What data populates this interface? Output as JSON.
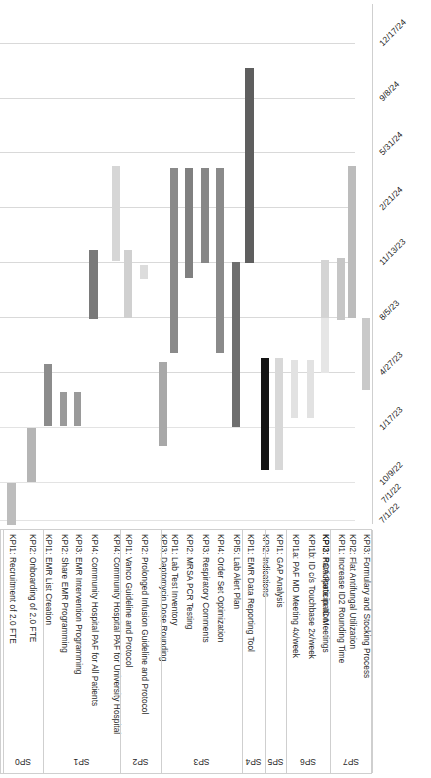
{
  "chart_data": {
    "type": "bar",
    "title": "",
    "subtitle": "",
    "xlabel": "",
    "ylabel": "",
    "orientation": "rotated-gantt",
    "grid": true,
    "legend": "none",
    "axis": {
      "name": "date-axis",
      "position": "right",
      "ticks": [
        "12/17/24",
        "9/8/24",
        "5/31/24",
        "2/21/24",
        "11/13/23",
        "8/5/23",
        "4/27/23",
        "1/17/23",
        "10/9/22",
        "7/1/22"
      ],
      "tick_y_px": [
        43,
        98,
        152,
        207,
        262,
        317,
        372,
        427,
        482,
        520
      ],
      "range": [
        "7/1/22",
        "12/17/24"
      ],
      "direction": "descending-downward"
    },
    "groups": [
      {
        "id": "SP0",
        "label": "SP0",
        "x": 2,
        "w": 40
      },
      {
        "id": "SP1",
        "label": "SP1",
        "x": 42,
        "w": 77
      },
      {
        "id": "SP2",
        "label": "SP2",
        "x": 119,
        "w": 41
      },
      {
        "id": "SP3",
        "label": "SP3",
        "x": 160,
        "w": 81
      },
      {
        "id": "SP4",
        "label": "SP4",
        "x": 241,
        "w": 23
      },
      {
        "id": "SP5",
        "label": "SP5",
        "x": 264,
        "w": 21
      },
      {
        "id": "SP6",
        "label": "SP6",
        "x": 285,
        "w": 44
      },
      {
        "id": "SP7",
        "label": "SP7",
        "x": 329,
        "w": 42
      }
    ],
    "categories": [
      "KPI1: Recruitment of 2.0 FTE",
      "KPI2: Onboarding of 2.0 FTE",
      "KPI1: EMR List Creation",
      "KPI2: Share EMR Programming",
      "KPI3: EMR Intervention Programming",
      "KPI4: Community Hospital PAF for All Patients",
      "KPI4: Community Hospital PAF for University Hospital",
      "KPI1: Vanco Guideline and Protocol",
      "KPI2: Prolonged Infusion Guideline and Protocol",
      "KPI3: Daptomycin Dose Rounding",
      "KPI1: Lab Test Inventory",
      "KPI2: MRSA PCR Testing",
      "KPI3: Respiratory Comments",
      "KPI4: Order Set Optimization",
      "KPI5: Lab Alert Plan",
      "KPI1: EMR Data Reporting Tool",
      "KPI2: Indications",
      "KPI1: GAP Analysis",
      "KPI1a: PAF MD Meeting 4x/week",
      "KPI1b: ID c/s Touchbase 2x/week",
      "KPI2: Participate in IC Meetings",
      "KPI3: RCA Participation",
      "KPI1: Increase ID2 Rounding Time",
      "KPI2: Flat Antifungal Utilization",
      "KPI3: Formulary and Stocking Process"
    ],
    "bars": [
      {
        "name": "KPI1: Recruitment of 2.0 FTE",
        "group": "SP0",
        "x": 7,
        "w": 9,
        "y": 483,
        "h": 42,
        "color": "#bdbdbd",
        "start": "~7/1/22",
        "end": "~10/9/22"
      },
      {
        "name": "KPI2: Onboarding of 2.0 FTE",
        "group": "SP0",
        "x": 27,
        "w": 9,
        "y": 428,
        "h": 54,
        "color": "#b5b5b5",
        "start": "~10/9/22",
        "end": "~1/17/23"
      },
      {
        "name": "KPI1: EMR List Creation",
        "group": "SP1",
        "x": 44,
        "w": 8,
        "y": 364,
        "h": 62,
        "color": "#8c8c8c",
        "start": "~1/10/23",
        "end": "~4/27/23"
      },
      {
        "name": "KPI2: Share EMR Programming",
        "group": "SP1",
        "x": 60,
        "w": 7,
        "y": 392,
        "h": 34,
        "color": "#9a9a9a",
        "start": "~1/17/23",
        "end": "~3/20/23"
      },
      {
        "name": "KPI3: EMR Intervention Programming",
        "group": "SP1",
        "x": 74,
        "w": 7,
        "y": 392,
        "h": 34,
        "color": "#9a9a9a",
        "start": "~1/17/23",
        "end": "~3/20/23"
      },
      {
        "name": "KPI4: Community Hospital PAF for All Patients",
        "group": "SP1",
        "x": 89,
        "w": 9,
        "y": 250,
        "h": 69,
        "color": "#7a7a7a",
        "start": "~4/27/23",
        "end": "~9/20/23"
      },
      {
        "name": "KPI4: Community Hospital PAF for University Hosp.",
        "group": "SP1",
        "x": 112,
        "w": 8,
        "y": 166,
        "h": 95,
        "color": "#d6d6d6",
        "start": "~9/20/23",
        "end": "~2/28/24"
      },
      {
        "name": "KPI1: Vanco Guideline and Protocol",
        "group": "SP2",
        "x": 124,
        "w": 8,
        "y": 250,
        "h": 68,
        "color": "#d0d0d0",
        "start": "~4/27/23",
        "end": "~9/20/23"
      },
      {
        "name": "KPI2: Prolonged Infusion Guideline and Protocol",
        "group": "SP2",
        "x": 140,
        "w": 8,
        "y": 265,
        "h": 14,
        "color": "#dcdcdc",
        "start": "~8/5/23",
        "end": "~9/15/23"
      },
      {
        "name": "KPI3: Daptomycin Dose Rounding",
        "group": "SP2",
        "x": 159,
        "w": 8,
        "y": 362,
        "h": 84,
        "color": "#a8a8a8",
        "start": "~12/1/22",
        "end": "~4/27/23"
      },
      {
        "name": "KPI1: Lab Test Inventory",
        "group": "SP3",
        "x": 170,
        "w": 8,
        "y": 168,
        "h": 185,
        "color": "#8a8a8a",
        "start": "~4/27/23",
        "end": "~2/21/24"
      },
      {
        "name": "KPI2: MRSA PCR Testing",
        "group": "SP3",
        "x": 185,
        "w": 8,
        "y": 168,
        "h": 110,
        "color": "#808080",
        "start": "~9/20/23",
        "end": "~2/21/24"
      },
      {
        "name": "KPI3: Respiratory Comments",
        "group": "SP3",
        "x": 201,
        "w": 8,
        "y": 168,
        "h": 95,
        "color": "#878787",
        "start": "~11/13/23",
        "end": "~2/21/24"
      },
      {
        "name": "KPI4: Order Set Optimization",
        "group": "SP3",
        "x": 216,
        "w": 8,
        "y": 168,
        "h": 185,
        "color": "#8a8a8a",
        "start": "~4/27/23",
        "end": "~2/21/24"
      },
      {
        "name": "KPI5: Lab Alert Plan",
        "group": "SP3",
        "x": 232,
        "w": 8,
        "y": 262,
        "h": 165,
        "color": "#6e6e6e",
        "start": "~1/17/23",
        "end": "~11/13/23"
      },
      {
        "name": "KPI1: EMR Data Reporting Tool",
        "group": "SP4",
        "x": 245,
        "w": 9,
        "y": 68,
        "h": 195,
        "color": "#5e5e5e",
        "start": "~11/13/23",
        "end": "~9/8/24"
      },
      {
        "name": "KPI2: Indications",
        "group": "SP4",
        "x": 261,
        "w": 8,
        "y": 358,
        "h": 112,
        "color": "#141414",
        "start": "~12/1/22",
        "end": "~4/27/23"
      },
      {
        "name": "KPI1: GAP Analysis",
        "group": "SP5",
        "x": 275,
        "w": 8,
        "y": 358,
        "h": 112,
        "color": "#d8d8d8",
        "start": "~12/1/22",
        "end": "~4/27/23"
      },
      {
        "name": "KPI1a: PAF MD Meeting 4x/week",
        "group": "SP6",
        "x": 291,
        "w": 7,
        "y": 360,
        "h": 58,
        "color": "#e2e2e2",
        "start": "~2/5/23",
        "end": "~4/27/23"
      },
      {
        "name": "KPI1b: ID c/s Touchbase 2x/week",
        "group": "SP6",
        "x": 307,
        "w": 7,
        "y": 360,
        "h": 58,
        "color": "#e2e2e2",
        "start": "~2/5/23",
        "end": "~4/27/23"
      },
      {
        "name": "KPI2: Participate in IC Meetings",
        "group": "SP6",
        "x": 321,
        "w": 8,
        "y": 260,
        "h": 58,
        "color": "#d4d4d4",
        "start": "~4/27/23",
        "end": "~8/5/23"
      },
      {
        "name": "KPI3: RCA Participation",
        "group": "SP6",
        "x": 321,
        "w": 8,
        "y": 318,
        "h": 55,
        "color": "#e6e6e6",
        "start": "~4/27/23",
        "end": "~8/5/23"
      },
      {
        "name": "KPI1: Increase ID2 Rounding Time",
        "group": "SP7",
        "x": 337,
        "w": 8,
        "y": 258,
        "h": 62,
        "color": "#c6c6c6",
        "start": "~4/27/23",
        "end": "~8/5/23"
      },
      {
        "name": "KPI2: Flat Antifungal Utilization",
        "group": "SP7",
        "x": 348,
        "w": 8,
        "y": 166,
        "h": 152,
        "color": "#bcbcbc",
        "start": "~4/27/23",
        "end": "~2/21/24"
      },
      {
        "name": "KPI3: Formulary and Stocking Process",
        "group": "SP7",
        "x": 362,
        "w": 8,
        "y": 318,
        "h": 72,
        "color": "#c9c9c9",
        "start": "~1/17/23",
        "end": "~4/27/23"
      }
    ]
  },
  "corner": {
    "date": "7/1/22"
  }
}
